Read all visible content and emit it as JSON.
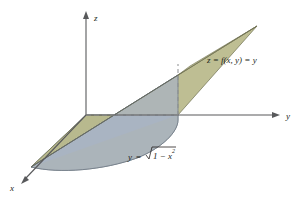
{
  "figure": {
    "background_color": "#ffffff",
    "axes": [
      {
        "name": "z",
        "label": "z",
        "direction": "up",
        "arrow": true
      },
      {
        "name": "y",
        "label": "y",
        "direction": "right",
        "arrow": true
      },
      {
        "name": "x",
        "label": "x",
        "direction": "down-left",
        "arrow": true
      }
    ],
    "axis_color": "#58595b",
    "labels": {
      "z_axis": "z",
      "y_axis": "y",
      "x_axis": "x",
      "surface_lhs": "z",
      "surface_eq1": "= f(x, y) =",
      "surface_fn": "y",
      "surface_full": "z = f(x, y) = y",
      "curve_lhs": "y",
      "curve_eq": "=",
      "curve_radicand_base": "1 − x",
      "curve_radicand_exp": "2",
      "curve_full": "y = √(1 − x²)"
    },
    "surfaces": [
      {
        "name": "plane-z-equals-y",
        "label": "z = f(x, y) = y",
        "fill": "#b9b98a",
        "stroke": "#6f7052",
        "opacity": 0.92
      },
      {
        "name": "cylindrical-wall",
        "label": "vertical surface over boundary curve",
        "fill": "#a8b2c4",
        "stroke": "#6b7585",
        "opacity": 0.85
      },
      {
        "name": "floor-half-disk",
        "label": "region in xy-plane",
        "fill": "#9aa8ae",
        "stroke": "#5f6d73",
        "opacity": 0.85
      }
    ],
    "dashed_lines": [
      {
        "name": "origin-horizontal-dashed",
        "style": "dashed"
      },
      {
        "name": "right-vertical-dashed",
        "style": "dashed"
      }
    ],
    "colors": {
      "plane_olive": "#b9b98a",
      "wall_blue": "#a8b2c4",
      "floor_blue_gray": "#9aa8ae",
      "axis_gray": "#58595b",
      "text_black": "#231f20"
    }
  }
}
